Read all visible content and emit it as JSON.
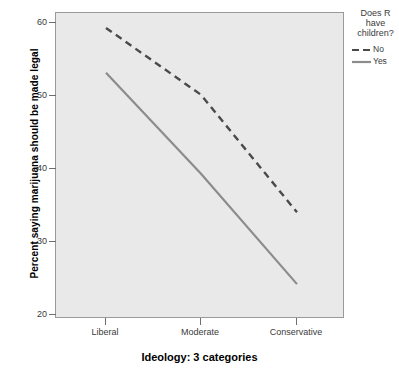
{
  "chart_data": {
    "type": "line",
    "title": "",
    "xlabel": "Ideology: 3 categories",
    "ylabel": "Percent saying marijuana should be made legal",
    "categories": [
      "Liberal",
      "Moderate",
      "Conservative"
    ],
    "xticklabels": [
      "Liberal",
      "Moderate",
      "Conservative"
    ],
    "yticklabels": [
      "20",
      "30",
      "40",
      "50",
      "60"
    ],
    "yticks": [
      20,
      30,
      40,
      50,
      60
    ],
    "ylim": [
      18.0,
      61.0
    ],
    "grid": false,
    "legend_position": "right",
    "legend_title": "Does R have children?",
    "series": [
      {
        "name": "No",
        "style": "dashed",
        "color": "#4a4a4a",
        "values": [
          58.9,
          49.5,
          33.0
        ]
      },
      {
        "name": "Yes",
        "style": "solid",
        "color": "#8c8c8c",
        "values": [
          52.6,
          38.4,
          22.9
        ]
      }
    ]
  },
  "axes": {
    "y_title": "Percent saying marijuana should be made legal",
    "x_title": "Ideology: 3 categories",
    "y_tick_labels": [
      "60",
      "50",
      "40",
      "30",
      "20"
    ],
    "x_tick_labels": [
      "Liberal",
      "Moderate",
      "Conservative"
    ]
  },
  "legend": {
    "title_line1": "Does R",
    "title_line2": "have",
    "title_line3": "children?",
    "entries": [
      {
        "label": "No",
        "swatch": "dashed-line-swatch"
      },
      {
        "label": "Yes",
        "swatch": "solid-line-swatch"
      }
    ]
  },
  "colors": {
    "plot_background": "#e9e9e9",
    "figure_background": "#ffffff",
    "frame": "#9a9a9a",
    "series_no": "#4a4a4a",
    "series_yes": "#8c8c8c",
    "tick_text": "#3a3a3a",
    "title_text": "#000000"
  }
}
